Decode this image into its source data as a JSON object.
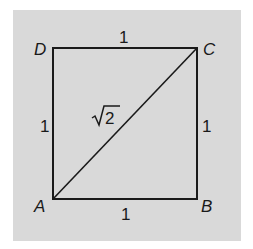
{
  "diagram": {
    "type": "square-with-diagonal",
    "vertices": {
      "A": {
        "label": "A",
        "x": 53,
        "y": 199
      },
      "B": {
        "label": "B",
        "x": 197,
        "y": 199
      },
      "C": {
        "label": "C",
        "x": 197,
        "y": 48
      },
      "D": {
        "label": "D",
        "x": 53,
        "y": 48
      }
    },
    "side_labels": {
      "top": "1",
      "bottom": "1",
      "left": "1",
      "right": "1"
    },
    "diagonal": {
      "from": "A",
      "to": "C",
      "label_radical": "√",
      "label_value": "2"
    },
    "colors": {
      "background": "#d9d9d9",
      "stroke": "#1a1a1a"
    }
  }
}
